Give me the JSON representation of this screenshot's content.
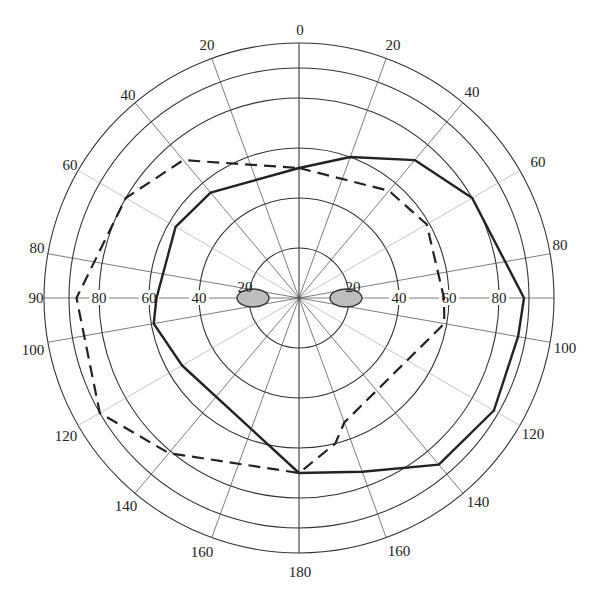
{
  "chart_data": {
    "type": "polar-line",
    "title": "",
    "center": [
      299,
      298
    ],
    "px_per_unit": 2.5,
    "angular_unit": "degrees, measured from top (0) clockwise on right side and counter-clockwise on left side, symmetric 0-180",
    "rings": [
      20,
      40,
      60,
      80,
      92,
      102
    ],
    "radial_ticks": {
      "left": [
        "20",
        "40",
        "60",
        "80"
      ],
      "right": [
        "20",
        "40",
        "60",
        "80"
      ]
    },
    "spoke_angles": [
      0,
      20,
      40,
      60,
      80,
      90,
      100,
      120,
      140,
      160,
      180
    ],
    "angle_labels": [
      {
        "text": "0",
        "x": 300,
        "y": 35
      },
      {
        "text": "20",
        "x": 207,
        "y": 50
      },
      {
        "text": "20",
        "x": 393,
        "y": 50
      },
      {
        "text": "40",
        "x": 128,
        "y": 100
      },
      {
        "text": "40",
        "x": 472,
        "y": 97
      },
      {
        "text": "60",
        "x": 70,
        "y": 170
      },
      {
        "text": "60",
        "x": 538,
        "y": 167
      },
      {
        "text": "80",
        "x": 37,
        "y": 253
      },
      {
        "text": "80",
        "x": 560,
        "y": 250
      },
      {
        "text": "90",
        "x": 36,
        "y": 303
      },
      {
        "text": "100",
        "x": 33,
        "y": 355
      },
      {
        "text": "100",
        "x": 565,
        "y": 353
      },
      {
        "text": "120",
        "x": 66,
        "y": 441
      },
      {
        "text": "120",
        "x": 533,
        "y": 439
      },
      {
        "text": "140",
        "x": 126,
        "y": 511
      },
      {
        "text": "140",
        "x": 478,
        "y": 507
      },
      {
        "text": "160",
        "x": 202,
        "y": 557
      },
      {
        "text": "160",
        "x": 399,
        "y": 556
      },
      {
        "text": "180",
        "x": 300,
        "y": 577
      }
    ],
    "series": [
      {
        "name": "solid",
        "style": "solid",
        "color": "#222222",
        "points_right": [
          [
            0,
            52
          ],
          [
            20,
            60
          ],
          [
            40,
            72
          ],
          [
            60,
            80
          ],
          [
            90,
            90
          ],
          [
            100,
            89
          ],
          [
            120,
            90
          ],
          [
            140,
            87
          ],
          [
            160,
            74
          ],
          [
            180,
            70
          ]
        ],
        "points_left": [
          [
            0,
            52
          ],
          [
            40,
            55
          ],
          [
            60,
            57
          ],
          [
            90,
            57
          ],
          [
            100,
            59
          ],
          [
            120,
            54
          ],
          [
            180,
            70
          ]
        ]
      },
      {
        "name": "dashed",
        "style": "dashed",
        "color": "#222222",
        "points_right": [
          [
            0,
            52
          ],
          [
            40,
            56
          ],
          [
            60,
            59
          ],
          [
            90,
            58
          ],
          [
            100,
            59
          ],
          [
            160,
            53
          ],
          [
            166,
            60
          ],
          [
            180,
            70
          ]
        ],
        "points_left": [
          [
            0,
            52
          ],
          [
            40,
            72
          ],
          [
            60,
            80
          ],
          [
            90,
            89
          ],
          [
            120,
            92
          ],
          [
            140,
            81
          ],
          [
            180,
            70
          ]
        ]
      }
    ],
    "blobs": [
      {
        "name": "left-lobe",
        "cx": 253,
        "cy": 298,
        "rx": 16,
        "ry": 9,
        "fill": "#bdbdbd"
      },
      {
        "name": "right-lobe",
        "cx": 346,
        "cy": 298,
        "rx": 16,
        "ry": 9,
        "fill": "#bdbdbd"
      }
    ],
    "grid": true,
    "legend": null
  }
}
